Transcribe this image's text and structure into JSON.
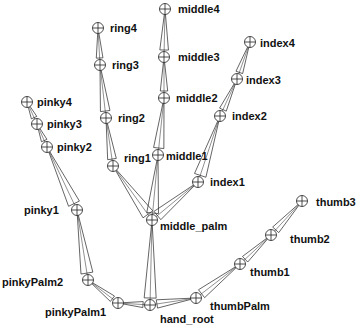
{
  "colors": {
    "line": "#222222",
    "text": "#111111",
    "background": "#ffffff"
  },
  "joints": [
    {
      "id": "hand_root",
      "label": "hand_root",
      "x": 150,
      "y": 305,
      "lx": 160,
      "ly": 313,
      "parent": null
    },
    {
      "id": "middle_palm",
      "label": "middle_palm",
      "x": 152,
      "y": 220,
      "lx": 160,
      "ly": 220,
      "parent": "hand_root"
    },
    {
      "id": "middle1",
      "label": "middle1",
      "x": 158,
      "y": 155,
      "lx": 166,
      "ly": 150,
      "parent": "middle_palm"
    },
    {
      "id": "middle2",
      "label": "middle2",
      "x": 164,
      "y": 98,
      "lx": 176,
      "ly": 92,
      "parent": "middle1"
    },
    {
      "id": "middle3",
      "label": "middle3",
      "x": 164,
      "y": 57,
      "lx": 178,
      "ly": 51,
      "parent": "middle2"
    },
    {
      "id": "middle4",
      "label": "middle4",
      "x": 165,
      "y": 9,
      "lx": 178,
      "ly": 3,
      "parent": "middle3"
    },
    {
      "id": "ring1",
      "label": "ring1",
      "x": 113,
      "y": 166,
      "lx": 124,
      "ly": 152,
      "parent": "middle_palm"
    },
    {
      "id": "ring2",
      "label": "ring2",
      "x": 106,
      "y": 118,
      "lx": 118,
      "ly": 112,
      "parent": "ring1"
    },
    {
      "id": "ring3",
      "label": "ring3",
      "x": 100,
      "y": 65,
      "lx": 112,
      "ly": 59,
      "parent": "ring2"
    },
    {
      "id": "ring4",
      "label": "ring4",
      "x": 98,
      "y": 28,
      "lx": 110,
      "ly": 22,
      "parent": "ring3"
    },
    {
      "id": "index1",
      "label": "index1",
      "x": 198,
      "y": 182,
      "lx": 210,
      "ly": 176,
      "parent": "middle_palm"
    },
    {
      "id": "index2",
      "label": "index2",
      "x": 220,
      "y": 116,
      "lx": 232,
      "ly": 110,
      "parent": "index1"
    },
    {
      "id": "index3",
      "label": "index3",
      "x": 237,
      "y": 79,
      "lx": 246,
      "ly": 74,
      "parent": "index2"
    },
    {
      "id": "index4",
      "label": "index4",
      "x": 250,
      "y": 42,
      "lx": 260,
      "ly": 37,
      "parent": "index3"
    },
    {
      "id": "pinkyPalm1",
      "label": "pinkyPalm1",
      "x": 118,
      "y": 303,
      "lx": 45,
      "ly": 142,
      "parent": "hand_root"
    },
    {
      "id": "pinkyPalm2",
      "label": "pinkyPalm2",
      "x": 88,
      "y": 280,
      "lx": 2,
      "ly": 276,
      "parent": "pinkyPalm1"
    },
    {
      "id": "pinky1",
      "label": "pinky1",
      "x": 77,
      "y": 210,
      "lx": 24,
      "ly": 204,
      "parent": "pinkyPalm2"
    },
    {
      "id": "pinky2",
      "label": "pinky2",
      "x": 47,
      "y": 147,
      "lx": 57,
      "ly": 141,
      "parent": "pinky1"
    },
    {
      "id": "pinky3",
      "label": "pinky3",
      "x": 37,
      "y": 124,
      "lx": 47,
      "ly": 118,
      "parent": "pinky2"
    },
    {
      "id": "pinky4",
      "label": "pinky4",
      "x": 27,
      "y": 102,
      "lx": 37,
      "ly": 96,
      "parent": "pinky3"
    },
    {
      "id": "thumbPalm",
      "label": "thumbPalm",
      "x": 196,
      "y": 298,
      "lx": 210,
      "ly": 300,
      "parent": "hand_root"
    },
    {
      "id": "thumb1",
      "label": "thumb1",
      "x": 240,
      "y": 264,
      "lx": 250,
      "ly": 266,
      "parent": "thumbPalm"
    },
    {
      "id": "thumb2",
      "label": "thumb2",
      "x": 271,
      "y": 235,
      "lx": 290,
      "ly": 233,
      "parent": "thumb1"
    },
    {
      "id": "thumb3",
      "label": "thumb3",
      "x": 302,
      "y": 201,
      "lx": 316,
      "ly": 196,
      "parent": "thumb2"
    }
  ]
}
